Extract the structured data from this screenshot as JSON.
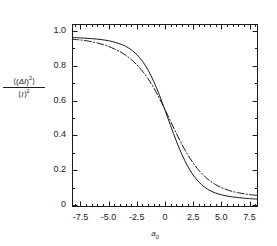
{
  "chart_data": {
    "type": "line",
    "title": "",
    "subtitle": "",
    "xlabel": "a0",
    "xlabel_parts": {
      "base": "a",
      "sub": "0"
    },
    "ylabel": "<(DI)^2>/<I>^2",
    "ylabel_parts": {
      "numerator_open": "⟨(",
      "numerator_delta": "ΔI",
      "numerator_close": ")",
      "numerator_exp": "2",
      "numerator_end": "⟩",
      "denominator_open": "⟨",
      "denominator_var": "I",
      "denominator_close": "⟩",
      "denominator_exp": "2"
    },
    "xlim": [
      -8.25,
      8.25
    ],
    "ylim": [
      -0.012,
      1.04
    ],
    "xticks": [
      -7.5,
      -5.0,
      -2.5,
      0,
      2.5,
      5.0,
      7.5
    ],
    "xticklabels": [
      "-7.5",
      "-5.0",
      "-2.5",
      "0",
      "2.5",
      "5.0",
      "7.5"
    ],
    "yticks": [
      0,
      0.2,
      0.4,
      0.6,
      0.8,
      1.0
    ],
    "yticklabels": [
      "0",
      "0.2",
      "0.4",
      "0.6",
      "0.8",
      "1.0"
    ],
    "x_minor_per_major": 5,
    "y_minor_per_major": 2,
    "grid": false,
    "legend": false,
    "legend_position": "none",
    "frame": true,
    "tick_direction": "in",
    "axis_color": "#1a1a1a",
    "background": "#ffffff",
    "series": [
      {
        "name": "solid",
        "style": "solid",
        "color": "#1a1a1a",
        "width": 1.0,
        "x": [
          -8.25,
          -7.75,
          -7.5,
          -7.0,
          -6.5,
          -6.0,
          -5.5,
          -5.0,
          -4.5,
          -4.0,
          -3.5,
          -3.0,
          -2.5,
          -2.0,
          -1.5,
          -1.0,
          -0.5,
          0.0,
          0.5,
          1.0,
          1.5,
          2.0,
          2.5,
          3.0,
          3.5,
          4.0,
          4.5,
          5.0,
          5.5,
          6.0,
          6.5,
          7.0,
          7.5,
          8.0,
          8.25
        ],
        "y": [
          0.962,
          0.961,
          0.96,
          0.958,
          0.956,
          0.953,
          0.949,
          0.944,
          0.936,
          0.926,
          0.912,
          0.892,
          0.864,
          0.826,
          0.775,
          0.71,
          0.632,
          0.545,
          0.455,
          0.368,
          0.29,
          0.224,
          0.172,
          0.132,
          0.103,
          0.082,
          0.068,
          0.058,
          0.051,
          0.046,
          0.042,
          0.039,
          0.036,
          0.034,
          0.033
        ]
      },
      {
        "name": "dash-dot",
        "style": "dashdot",
        "color": "#1a1a1a",
        "width": 1.0,
        "x": [
          -8.25,
          -7.75,
          -7.5,
          -7.0,
          -6.5,
          -6.0,
          -5.5,
          -5.0,
          -4.5,
          -4.0,
          -3.5,
          -3.0,
          -2.5,
          -2.0,
          -1.5,
          -1.0,
          -0.5,
          0.0,
          0.5,
          1.0,
          1.5,
          2.0,
          2.5,
          3.0,
          3.5,
          4.0,
          4.5,
          5.0,
          5.5,
          6.0,
          6.5,
          7.0,
          7.5,
          8.0,
          8.25
        ],
        "y": [
          0.952,
          0.95,
          0.948,
          0.944,
          0.938,
          0.931,
          0.922,
          0.911,
          0.897,
          0.881,
          0.861,
          0.836,
          0.806,
          0.769,
          0.725,
          0.673,
          0.613,
          0.548,
          0.48,
          0.412,
          0.348,
          0.291,
          0.241,
          0.199,
          0.165,
          0.138,
          0.116,
          0.1,
          0.087,
          0.077,
          0.07,
          0.064,
          0.059,
          0.056,
          0.054
        ]
      }
    ],
    "annotations": [],
    "crossing_point": {
      "x": -0.4,
      "y": 0.6
    }
  },
  "plot_box": {
    "left": 72,
    "top": 24,
    "right": 258,
    "bottom": 207
  }
}
